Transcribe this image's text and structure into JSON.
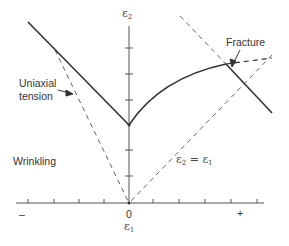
{
  "diagram": {
    "axes": {
      "x_label_symbol": "ε",
      "x_label_sub": "1",
      "y_label_symbol": "ε",
      "y_label_sub": "2",
      "origin_label": "0",
      "x_negative_label": "–",
      "x_positive_label": "+"
    },
    "labels": {
      "uniaxial": "Uniaxial",
      "tension": "tension",
      "wrinkling": "Wrinkling",
      "fracture": "Fracture",
      "equal_strain": "ε",
      "equal_strain_sub2": "2",
      "equal_strain_eq": " = ε",
      "equal_strain_sub1": "1"
    },
    "colors": {
      "line": "#333333",
      "dashed": "#555555",
      "axis": "#444444"
    }
  }
}
